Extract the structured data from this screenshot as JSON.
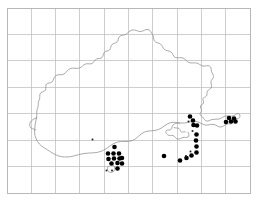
{
  "figure": {
    "name": "species-distribution-map",
    "type": "dot-distribution-map",
    "region_outline": "coastal county outline",
    "background_color": "#ffffff",
    "frame_color": "#b0b0b0",
    "grid_color": "#b9b9b9",
    "coastline_color": "#8e8e8e",
    "dot_color": "#000000"
  },
  "grid": {
    "columns": 10,
    "rows": 7,
    "cell_width": 24.3,
    "cell_height": 26.4,
    "origin_x": 7,
    "origin_y": 8,
    "frame_width": 243,
    "frame_height": 185,
    "show_labels": false,
    "show_grid": true
  },
  "chart_data": {
    "type": "scatter",
    "title": "",
    "xlabel": "",
    "ylabel": "",
    "xlim": [
      7,
      250
    ],
    "ylim": [
      8,
      193
    ],
    "grid": true,
    "legend": "none",
    "series": [
      {
        "name": "records-large",
        "marker": "filled-circle",
        "marker_size": 4.6,
        "color": "#000000",
        "points": [
          [
            114.5,
            147.0
          ],
          [
            108.0,
            153.5
          ],
          [
            113.5,
            153.5
          ],
          [
            119.0,
            153.5
          ],
          [
            108.5,
            159.0
          ],
          [
            114.0,
            158.5
          ],
          [
            119.5,
            158.5
          ],
          [
            111.5,
            163.5
          ],
          [
            117.5,
            163.0
          ],
          [
            122.0,
            158.0
          ],
          [
            122.0,
            163.5
          ],
          [
            117.5,
            168.5
          ],
          [
            164.0,
            156.0
          ],
          [
            180.0,
            160.5
          ],
          [
            186.5,
            158.0
          ],
          [
            191.5,
            155.5
          ],
          [
            196.5,
            152.5
          ],
          [
            196.5,
            146.5
          ],
          [
            196.0,
            140.5
          ],
          [
            196.5,
            134.5
          ],
          [
            193.5,
            125.0
          ],
          [
            197.0,
            125.5
          ],
          [
            193.0,
            120.5
          ],
          [
            190.0,
            116.5
          ],
          [
            226.0,
            122.0
          ],
          [
            231.0,
            121.5
          ],
          [
            235.5,
            121.5
          ],
          [
            229.0,
            118.0
          ],
          [
            234.0,
            118.5
          ]
        ]
      },
      {
        "name": "records-small",
        "marker": "filled-square-small",
        "marker_size": 1.7,
        "color": "#1a1a1a",
        "points": [
          [
            92.5,
            139.5
          ],
          [
            106.5,
            170.5
          ],
          [
            112.0,
            170.5
          ],
          [
            188.5,
            121.5
          ],
          [
            192.5,
            131.0
          ],
          [
            190.5,
            151.5
          ],
          [
            186.0,
            156.0
          ]
        ]
      }
    ],
    "total_records": 36
  },
  "coastline": {
    "description": "County coastal and inland boundary outline",
    "closed": false,
    "segments": [
      "north-boundary",
      "east-coast",
      "south-coast",
      "west-boundary",
      "harbour-inset"
    ]
  }
}
